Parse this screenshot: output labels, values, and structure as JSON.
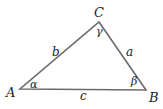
{
  "diagram": {
    "type": "triangle",
    "stroke_color": "#6b6b6b",
    "vertices": {
      "A": {
        "label": "A",
        "x": 20,
        "y": 89
      },
      "B": {
        "label": "B",
        "x": 146,
        "y": 90
      },
      "C": {
        "label": "C",
        "x": 99,
        "y": 22
      }
    },
    "sides": {
      "a": {
        "label": "a",
        "between": "B-C"
      },
      "b": {
        "label": "b",
        "between": "A-C"
      },
      "c": {
        "label": "c",
        "between": "A-B"
      }
    },
    "angles": {
      "alpha": {
        "label": "α",
        "at": "A"
      },
      "beta": {
        "label": "β",
        "at": "B"
      },
      "gamma": {
        "label": "γ",
        "at": "C"
      }
    }
  }
}
